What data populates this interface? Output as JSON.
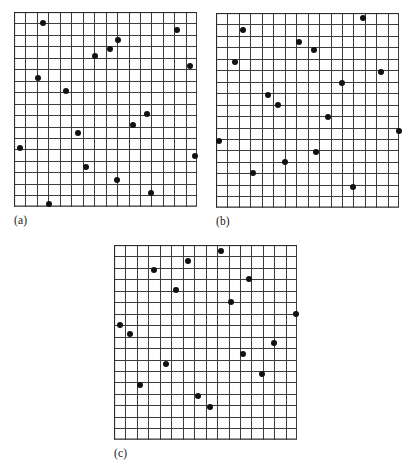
{
  "figure": {
    "type": "multi-panel-point-pattern",
    "width": 416,
    "height": 471,
    "background": "#ffffff",
    "grid_line_color": "#3a3a3a",
    "grid_border_color": "#2b2b2b",
    "dot_color": "#111111",
    "dot_radius_px": 3.0
  },
  "chart_data": {
    "type": "scatter",
    "title": "",
    "xlabel": "",
    "ylabel": "",
    "grid": true,
    "legend": "none",
    "grid_cols": 16,
    "grid_rows": 17,
    "xlim": [
      0,
      16
    ],
    "ylim": [
      0,
      17
    ],
    "panels": [
      {
        "id": "a",
        "label": "(a)",
        "n_points": 18,
        "points": [
          [
            2.55,
            0.95
          ],
          [
            9.05,
            2.45
          ],
          [
            14.2,
            1.55
          ],
          [
            8.4,
            3.25
          ],
          [
            7.05,
            3.85
          ],
          [
            15.4,
            4.7
          ],
          [
            2.1,
            5.75
          ],
          [
            4.5,
            6.9
          ],
          [
            11.65,
            8.95
          ],
          [
            10.4,
            9.85
          ],
          [
            5.6,
            10.6
          ],
          [
            0.55,
            11.9
          ],
          [
            15.85,
            12.55
          ],
          [
            6.25,
            13.55
          ],
          [
            9.0,
            14.65
          ],
          [
            11.95,
            15.85
          ],
          [
            3.1,
            16.75
          ]
        ]
      },
      {
        "id": "b",
        "label": "(b)",
        "n_points": 17,
        "points": [
          [
            12.8,
            0.45
          ],
          [
            2.35,
            1.5
          ],
          [
            7.25,
            2.55
          ],
          [
            8.55,
            3.2
          ],
          [
            1.65,
            4.3
          ],
          [
            14.4,
            5.15
          ],
          [
            11.0,
            6.15
          ],
          [
            4.55,
            7.15
          ],
          [
            5.4,
            8.0
          ],
          [
            9.75,
            9.1
          ],
          [
            16.0,
            10.3
          ],
          [
            0.3,
            11.2
          ],
          [
            8.75,
            12.1
          ],
          [
            6.05,
            13.05
          ],
          [
            3.25,
            13.95
          ],
          [
            11.95,
            15.2
          ]
        ]
      },
      {
        "id": "c",
        "label": "(c)",
        "n_points": 18,
        "points": [
          [
            9.35,
            0.55
          ],
          [
            6.45,
            1.4
          ],
          [
            3.45,
            2.15
          ],
          [
            11.75,
            3.0
          ],
          [
            5.45,
            3.95
          ],
          [
            10.2,
            5.0
          ],
          [
            15.9,
            6.05
          ],
          [
            0.5,
            6.95
          ],
          [
            1.4,
            7.8
          ],
          [
            13.95,
            8.55
          ],
          [
            11.3,
            9.5
          ],
          [
            4.5,
            10.35
          ],
          [
            12.95,
            11.3
          ],
          [
            2.3,
            12.2
          ],
          [
            7.3,
            13.2
          ],
          [
            8.35,
            14.15
          ]
        ]
      }
    ]
  },
  "layout": {
    "panels": [
      {
        "id": "a",
        "left": 14,
        "top": 12,
        "cell": 11.45,
        "label_left": 14,
        "label_top": 214
      },
      {
        "id": "b",
        "left": 216,
        "top": 13,
        "cell": 11.45,
        "label_left": 216,
        "label_top": 215
      },
      {
        "id": "c",
        "left": 114,
        "top": 245,
        "cell": 11.45,
        "label_left": 114,
        "label_top": 447
      }
    ]
  }
}
